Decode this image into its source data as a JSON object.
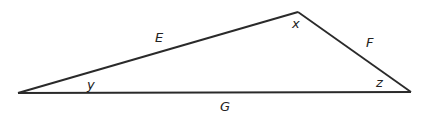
{
  "diagram": {
    "type": "triangle",
    "stroke_color": "#2a2a2a",
    "vertices": {
      "left": {
        "x": 18,
        "y": 93
      },
      "top": {
        "x": 298,
        "y": 12
      },
      "right": {
        "x": 411,
        "y": 92
      }
    },
    "sides": {
      "E": {
        "label": "E",
        "from": "left",
        "to": "top"
      },
      "F": {
        "label": "F",
        "from": "top",
        "to": "right"
      },
      "G": {
        "label": "G",
        "from": "left",
        "to": "right"
      }
    },
    "angles": {
      "x": {
        "label": "x",
        "at": "top"
      },
      "y": {
        "label": "y",
        "at": "left"
      },
      "z": {
        "label": "z",
        "at": "right"
      }
    }
  }
}
